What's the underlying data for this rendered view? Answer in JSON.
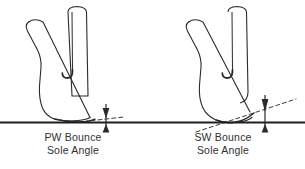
{
  "figure": {
    "background_color": "#ffffff",
    "ink_color": "#2b2b2b",
    "text_color": "#303030",
    "width": 305,
    "height": 169
  },
  "ground": {
    "label": "ground-line",
    "y": 122,
    "color": "#1f1f1f"
  },
  "clubs": [
    {
      "id": "pitching-wedge",
      "caption_line1": "PW Bounce",
      "caption_line2": "Sole Angle",
      "bounce": "shallow",
      "shaft": "vertical",
      "sole_dash_color": "#3a3a3a",
      "arrow": "double-headed-vertical"
    },
    {
      "id": "sand-wedge",
      "caption_line1": "SW Bounce",
      "caption_line2": "Sole Angle",
      "bounce": "steep",
      "shaft": "vertical",
      "sole_dash_color": "#3a3a3a",
      "arrow": "double-headed-vertical"
    }
  ],
  "captions": {
    "pw": {
      "line1": "PW Bounce",
      "line2": "Sole Angle"
    },
    "sw": {
      "line1": "SW Bounce",
      "line2": "Sole Angle"
    }
  }
}
